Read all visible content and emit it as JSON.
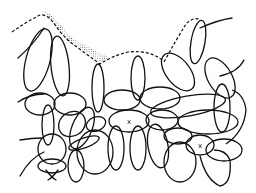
{
  "figure": {
    "type": "line-art cellular tissue diagram",
    "background": "#ffffff",
    "stroke_color": "#111111",
    "elements": {
      "boundary": "dashed upper margin line",
      "stippled_region": "dotted shading along upper-left boundary",
      "cells": "overlapping elliptical cell outlines",
      "markers": [
        {
          "label": "x",
          "x": 129,
          "y": 121
        },
        {
          "label": "x",
          "x": 200,
          "y": 145
        }
      ]
    }
  }
}
